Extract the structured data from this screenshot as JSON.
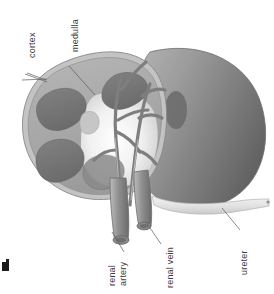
{
  "figure": {
    "orientation": "labels rotated 90 degrees counter-clockwise",
    "background_color": "#ffffff",
    "palette": {
      "cortex": "#a9a9a9",
      "cortex_edge": "#8f8f8f",
      "capsule": "#bdbdbd",
      "medulla_pyramid": "#787878",
      "pyramid_dark": "#6b6b6b",
      "pelvis": "#f2f2f2",
      "posterior_half": "#8d8d8d",
      "posterior_half_dark": "#6f6f6f",
      "vessel": "#9a9a9a",
      "vessel_dark": "#6e6e6e",
      "ureter": "#e3e3e3",
      "label_text": "#3b3b3b",
      "leader_line": "#5a5a5a"
    }
  },
  "labels": {
    "cortex": "cortex",
    "medulla": "medulla",
    "renal_artery_line1": "renal",
    "renal_artery_line2": "artery",
    "renal_vein": "renal vein",
    "ureter": "ureter"
  },
  "structures": [
    {
      "name": "cortex",
      "description": "outer light gray band of cut face"
    },
    {
      "name": "medulla",
      "description": "darker gray striated pyramids"
    },
    {
      "name": "renal pelvis",
      "description": "pale central cavity"
    },
    {
      "name": "renal artery",
      "description": "large vessel branching into kidney"
    },
    {
      "name": "renal vein",
      "description": "large vessel beside the artery"
    },
    {
      "name": "ureter",
      "description": "pale tube extending to the right"
    }
  ],
  "counts": {
    "medullary_pyramids_visible": 4
  }
}
